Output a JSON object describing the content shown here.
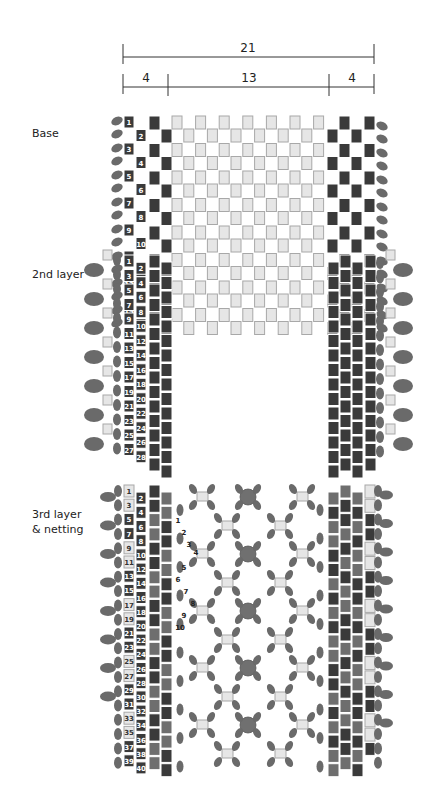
{
  "dimensions": {
    "total": "21",
    "left": "4",
    "center": "13",
    "right": "4"
  },
  "sections": {
    "base": {
      "label": "Base",
      "rows_numbered": 16,
      "numbers": [
        "1",
        "2",
        "3",
        "4",
        "5",
        "6",
        "7",
        "8",
        "9",
        "10",
        "11",
        "12",
        "13",
        "14",
        "15",
        "16"
      ]
    },
    "second_layer": {
      "label": "2nd layer",
      "rows_numbered": 28,
      "numbers": [
        "1",
        "2",
        "3",
        "4",
        "5",
        "6",
        "7",
        "8",
        "9",
        "10",
        "11",
        "12",
        "13",
        "14",
        "15",
        "16",
        "17",
        "18",
        "19",
        "20",
        "21",
        "22",
        "23",
        "24",
        "25",
        "26",
        "27",
        "28"
      ]
    },
    "third_layer": {
      "label_line1": "3rd layer",
      "label_line2": "& netting",
      "rows_numbered": 40,
      "numbers": [
        "1",
        "2",
        "3",
        "4",
        "5",
        "6",
        "7",
        "8",
        "9",
        "10",
        "11",
        "12",
        "13",
        "14",
        "15",
        "16",
        "17",
        "18",
        "19",
        "20",
        "21",
        "22",
        "23",
        "24",
        "25",
        "26",
        "27",
        "28",
        "29",
        "30",
        "31",
        "32",
        "33",
        "34",
        "35",
        "36",
        "37",
        "38",
        "39",
        "40"
      ],
      "netting_markers": [
        "1",
        "2",
        "3",
        "4",
        "5",
        "6",
        "7",
        "8",
        "9",
        "10"
      ]
    }
  },
  "colors": {
    "dark_bead": "#3a3a3a",
    "mid_bead": "#6e6e6e",
    "light_bead": "#e6e6e6",
    "light_bead_border": "#a8a8a8",
    "oval_bead": "#6a6a6a",
    "round_bead": "#707070",
    "line": "#333333"
  }
}
